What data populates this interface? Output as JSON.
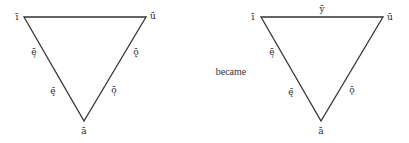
{
  "diagram": {
    "type": "vowel-triangle-comparison",
    "connector_text": "became",
    "line_color": "#333333",
    "before": {
      "vertices": {
        "top_left": "ī",
        "top_right": "ū",
        "bottom": "ā"
      },
      "left_edge": {
        "upper": "ē̜",
        "lower": "ę̄"
      },
      "right_edge": {
        "upper": "ǭ̣",
        "lower": "ō̜"
      },
      "top_edge": ""
    },
    "after": {
      "vertices": {
        "top_left": "ī",
        "top_right": "ū",
        "bottom": "ā"
      },
      "left_edge": {
        "upper": "ē̜",
        "lower": "ę̄"
      },
      "right_edge": {
        "lower": "ǭ"
      },
      "top_edge": "ȳ"
    }
  }
}
